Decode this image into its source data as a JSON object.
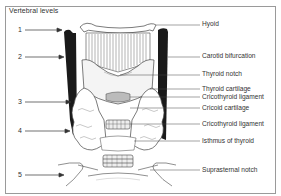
{
  "diagram": {
    "title": "Vertebral levels",
    "vertebral_levels": [
      {
        "label": "1",
        "y": 30
      },
      {
        "label": "2",
        "y": 57
      },
      {
        "label": "3",
        "y": 102
      },
      {
        "label": "4",
        "y": 131
      },
      {
        "label": "5",
        "y": 175
      }
    ],
    "structures": [
      {
        "label": "Hyoid",
        "y": 22
      },
      {
        "label": "Carotid bifurcation",
        "y": 55
      },
      {
        "label": "Thyroid notch",
        "y": 73
      },
      {
        "label": "Thyroid cartilage",
        "y": 88
      },
      {
        "label": "Cricothyroid ligament",
        "y": 96
      },
      {
        "label": "Cricoid cartilage",
        "y": 107
      },
      {
        "label": "Cricothyroid ligament",
        "y": 123
      },
      {
        "label": "Isthmus of thyroid",
        "y": 139
      },
      {
        "label": "Suprasternal notch",
        "y": 168
      }
    ]
  }
}
